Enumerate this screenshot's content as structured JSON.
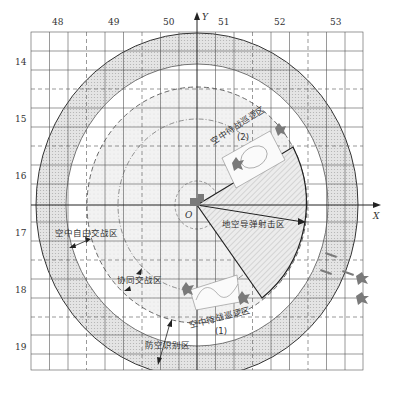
{
  "figure": {
    "type": "air-defense zone diagram",
    "axes": {
      "x_label": "X",
      "y_label": "Y",
      "origin_label": "O"
    },
    "top_ticks": [
      "48",
      "49",
      "50",
      "51",
      "52",
      "53"
    ],
    "left_ticks": [
      "14",
      "15",
      "16",
      "17",
      "18",
      "19"
    ]
  },
  "zones": {
    "free_engagement": "空中自由交战区",
    "coordinated_engagement": "协同交战区",
    "identification": "防空识别区",
    "sam_zone": "地空导弹射击区",
    "patrol_2": "空中待战巡逻区",
    "patrol_2_num": "(2)",
    "patrol_1": "空中待战巡逻区",
    "patrol_1_num": "(1)"
  },
  "colors": {
    "line": "#333333",
    "grid": "#555555",
    "ring_fill": "#d9d9d9",
    "inner_fill": "#eeeeee",
    "aircraft": "#7a7a7a"
  }
}
